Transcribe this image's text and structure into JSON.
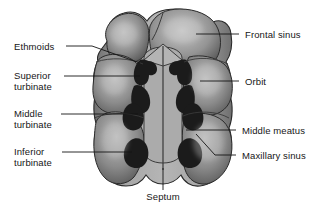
{
  "figure": {
    "background_color": "#ffffff",
    "line_color": "#1a1a1a",
    "text_color": "#161616",
    "tissue_light": "#b9b9b9",
    "tissue_mid": "#8e8e8e",
    "tissue_dark": "#5d5d5d",
    "cavity_color": "#1c1c1c"
  },
  "labels": {
    "ethmoids": "Ethmoids",
    "superior_turbinate_line1": "Superior",
    "superior_turbinate_line2": "turbinate",
    "middle_turbinate_line1": "Middle",
    "middle_turbinate_line2": "turbinate",
    "inferior_turbinate_line1": "Inferior",
    "inferior_turbinate_line2": "turbinate",
    "frontal_sinus": "Frontal sinus",
    "orbit": "Orbit",
    "middle_meatus": "Middle meatus",
    "maxillary_sinus": "Maxillary sinus",
    "septum": "Septum"
  }
}
